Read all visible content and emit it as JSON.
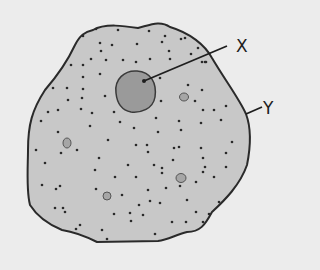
{
  "diagram": {
    "type": "cell-structure",
    "colors": {
      "background": "#ececec",
      "cytoplasm": "#c8c8c8",
      "outline": "#2a2a2a",
      "nucleus": "#9a9a9a",
      "vacuole": "#a6a6a6",
      "granule": "#2a2a2a"
    },
    "labels": [
      {
        "id": "X",
        "text": "X",
        "x": 236,
        "y": 52,
        "points_to": "nucleus",
        "line": [
          227,
          46,
          144,
          81
        ]
      },
      {
        "id": "Y",
        "text": "Y",
        "x": 263,
        "y": 114,
        "points_to": "cell-membrane",
        "line": [
          262,
          107,
          246,
          114
        ]
      }
    ],
    "cell_outline": "M 93 30 C 105 23 125 26 138 28 C 150 25 160 20 170 27 C 190 33 205 45 212 58 C 225 80 240 100 246 114 C 252 130 250 150 247 165 C 240 185 225 200 212 212 C 205 225 200 232 187 232 C 175 235 168 240 158 241 L 97 242 C 85 236 75 232 62 230 C 45 223 35 213 30 205 C 26 190 28 165 28 150 C 28 125 32 110 45 90 C 58 75 68 60 75 45 C 80 35 85 32 93 30 Z",
    "nucleus": {
      "cx": 135,
      "cy": 91,
      "rx": 21,
      "ry": 21
    },
    "vacuoles": [
      {
        "cx": 184,
        "cy": 97,
        "rx": 4.5,
        "ry": 4
      },
      {
        "cx": 67,
        "cy": 143,
        "rx": 4,
        "ry": 5
      },
      {
        "cx": 181,
        "cy": 178,
        "rx": 5,
        "ry": 4.5
      },
      {
        "cx": 107,
        "cy": 196,
        "rx": 4,
        "ry": 4
      }
    ],
    "granules": [
      [
        96,
        29
      ],
      [
        118,
        30
      ],
      [
        149,
        31
      ],
      [
        165,
        36
      ],
      [
        181,
        39
      ],
      [
        83,
        36
      ],
      [
        100,
        43
      ],
      [
        101,
        51
      ],
      [
        112,
        45
      ],
      [
        137,
        44
      ],
      [
        162,
        42
      ],
      [
        169,
        51
      ],
      [
        185,
        38
      ],
      [
        198,
        48
      ],
      [
        202,
        62
      ],
      [
        71,
        65
      ],
      [
        83,
        65
      ],
      [
        91,
        59
      ],
      [
        106,
        60
      ],
      [
        123,
        60
      ],
      [
        136,
        62
      ],
      [
        150,
        59
      ],
      [
        170,
        59
      ],
      [
        191,
        54
      ],
      [
        205,
        62
      ],
      [
        206,
        62
      ],
      [
        53,
        88
      ],
      [
        67,
        88
      ],
      [
        83,
        77
      ],
      [
        100,
        74
      ],
      [
        83,
        89
      ],
      [
        68,
        100
      ],
      [
        82,
        98
      ],
      [
        105,
        96
      ],
      [
        160,
        78
      ],
      [
        188,
        85
      ],
      [
        202,
        90
      ],
      [
        195,
        101
      ],
      [
        203,
        110
      ],
      [
        161,
        101
      ],
      [
        214,
        110
      ],
      [
        226,
        106
      ],
      [
        221,
        120
      ],
      [
        201,
        123
      ],
      [
        48,
        112
      ],
      [
        58,
        110
      ],
      [
        81,
        109
      ],
      [
        92,
        113
      ],
      [
        114,
        112
      ],
      [
        120,
        122
      ],
      [
        134,
        128
      ],
      [
        156,
        118
      ],
      [
        179,
        121
      ],
      [
        158,
        132
      ],
      [
        181,
        130
      ],
      [
        148,
        152
      ],
      [
        174,
        148
      ],
      [
        201,
        148
      ],
      [
        203,
        158
      ],
      [
        226,
        153
      ],
      [
        232,
        142
      ],
      [
        173,
        160
      ],
      [
        205,
        167
      ],
      [
        226,
        167
      ],
      [
        41,
        121
      ],
      [
        58,
        132
      ],
      [
        36,
        150
      ],
      [
        45,
        163
      ],
      [
        61,
        153
      ],
      [
        77,
        150
      ],
      [
        42,
        185
      ],
      [
        60,
        186
      ],
      [
        90,
        126
      ],
      [
        108,
        140
      ],
      [
        99,
        158
      ],
      [
        136,
        145
      ],
      [
        128,
        165
      ],
      [
        154,
        165
      ],
      [
        162,
        168
      ],
      [
        162,
        173
      ],
      [
        147,
        145
      ],
      [
        179,
        147
      ],
      [
        148,
        190
      ],
      [
        122,
        195
      ],
      [
        136,
        177
      ],
      [
        96,
        189
      ],
      [
        114,
        214
      ],
      [
        143,
        215
      ],
      [
        107,
        239
      ],
      [
        130,
        213
      ],
      [
        155,
        234
      ],
      [
        180,
        186
      ],
      [
        196,
        182
      ],
      [
        203,
        172
      ],
      [
        214,
        177
      ],
      [
        219,
        202
      ],
      [
        209,
        214
      ],
      [
        186,
        222
      ],
      [
        172,
        222
      ],
      [
        131,
        221
      ],
      [
        102,
        230
      ],
      [
        80,
        225
      ],
      [
        63,
        208
      ],
      [
        56,
        189
      ],
      [
        76,
        229
      ],
      [
        139,
        205
      ],
      [
        55,
        208
      ],
      [
        65,
        212
      ],
      [
        95,
        170
      ],
      [
        115,
        177
      ],
      [
        166,
        188
      ],
      [
        187,
        200
      ],
      [
        196,
        212
      ],
      [
        203,
        222
      ],
      [
        160,
        203
      ],
      [
        150,
        201
      ]
    ]
  }
}
